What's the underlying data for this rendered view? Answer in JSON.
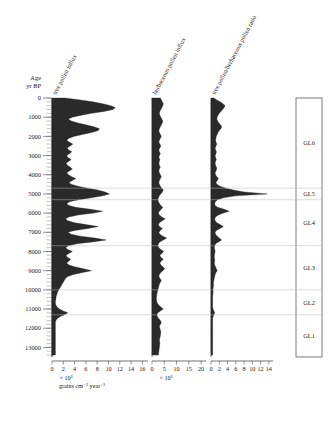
{
  "figure": {
    "age_axis": {
      "label_line1": "Age",
      "label_line2": "yr BP",
      "ticks": [
        0,
        1000,
        2000,
        3000,
        4000,
        5000,
        6000,
        7000,
        8000,
        9000,
        10000,
        11000,
        12000,
        13000
      ],
      "range": [
        0,
        13500
      ],
      "minor_interval": 200
    },
    "units": {
      "influx_exponent": "× 10³",
      "influx_units": "grains cm⁻² year⁻¹"
    },
    "zones": {
      "items": [
        {
          "label": "GL6",
          "top": 0,
          "bottom": 4700
        },
        {
          "label": "GL5",
          "top": 4700,
          "bottom": 5300
        },
        {
          "label": "GL4",
          "top": 5300,
          "bottom": 7700
        },
        {
          "label": "GL3",
          "top": 7700,
          "bottom": 10000
        },
        {
          "label": "GL2",
          "top": 10000,
          "bottom": 11300
        },
        {
          "label": "GL1",
          "top": 11300,
          "bottom": 13500
        }
      ]
    }
  },
  "chart_data": [
    {
      "type": "area",
      "panel": 1,
      "title": "tree pollen influx",
      "xlabel": "× 10³ grains cm⁻² year⁻¹",
      "ylabel": "Age yr BP",
      "xlim": [
        0,
        17
      ],
      "ylim": [
        0,
        13500
      ],
      "xticks": [
        0,
        2,
        4,
        6,
        8,
        10,
        12,
        14,
        16
      ],
      "grid": false,
      "orientation": "horizontal-depth",
      "x": [
        0,
        100,
        200,
        300,
        400,
        500,
        600,
        700,
        800,
        900,
        1000,
        1100,
        1200,
        1300,
        1400,
        1500,
        1600,
        1700,
        1800,
        1900,
        2000,
        2100,
        2200,
        2300,
        2400,
        2500,
        2600,
        2700,
        2800,
        2900,
        3000,
        3100,
        3200,
        3300,
        3400,
        3500,
        3600,
        3700,
        3800,
        3900,
        4000,
        4100,
        4200,
        4300,
        4400,
        4500,
        4600,
        4700,
        4800,
        4900,
        5000,
        5100,
        5200,
        5300,
        5400,
        5500,
        5600,
        5700,
        5800,
        5900,
        6000,
        6100,
        6200,
        6300,
        6400,
        6500,
        6600,
        6700,
        6800,
        6900,
        7000,
        7100,
        7200,
        7300,
        7400,
        7500,
        7600,
        7700,
        7800,
        7900,
        8000,
        8100,
        8200,
        8300,
        8400,
        8500,
        8600,
        8700,
        8800,
        8900,
        9000,
        9100,
        9200,
        9300,
        9400,
        9500,
        9600,
        9700,
        9800,
        9900,
        10000,
        10100,
        10200,
        10300,
        10400,
        10500,
        10600,
        10700,
        10800,
        10900,
        11000,
        11100,
        11200,
        11300,
        11400,
        11500,
        11600,
        11700,
        11800,
        11900,
        12000,
        12200,
        12400,
        12600,
        12800,
        13000,
        13200,
        13400
      ],
      "values": [
        2.3,
        5.0,
        7.2,
        9.0,
        10.4,
        11.2,
        10.8,
        9.2,
        7.0,
        5.2,
        3.6,
        2.9,
        3.4,
        4.6,
        6.0,
        7.4,
        8.4,
        8.2,
        7.0,
        5.4,
        4.0,
        3.0,
        2.6,
        3.1,
        3.7,
        3.2,
        2.7,
        2.9,
        3.5,
        3.1,
        2.6,
        2.8,
        3.4,
        3.0,
        2.5,
        2.7,
        3.2,
        3.6,
        3.1,
        2.6,
        2.9,
        3.5,
        4.2,
        3.6,
        3.0,
        3.4,
        4.6,
        6.3,
        8.1,
        9.4,
        10.2,
        9.0,
        7.0,
        4.8,
        3.2,
        2.6,
        3.0,
        4.2,
        6.8,
        9.0,
        7.4,
        4.6,
        3.0,
        2.4,
        2.8,
        4.0,
        6.0,
        8.2,
        6.4,
        4.0,
        2.8,
        3.4,
        5.0,
        7.6,
        9.6,
        7.2,
        4.4,
        2.9,
        2.4,
        2.8,
        3.6,
        3.0,
        2.5,
        2.7,
        3.3,
        3.0,
        2.6,
        3.0,
        4.0,
        5.6,
        7.0,
        5.4,
        3.8,
        2.8,
        2.4,
        2.2,
        2.0,
        1.8,
        1.6,
        1.4,
        1.2,
        1.0,
        0.9,
        0.8,
        0.7,
        0.7,
        0.6,
        0.6,
        0.7,
        0.9,
        1.3,
        2.0,
        2.8,
        2.2,
        1.4,
        0.9,
        0.7,
        0.6,
        0.6,
        0.6,
        0.6,
        0.6,
        0.6,
        0.6,
        0.6,
        0.6,
        0.6,
        0.6
      ]
    },
    {
      "type": "area",
      "panel": 2,
      "title": "herbaceous pollen influx",
      "xlabel": "× 10³ grains cm⁻² year⁻¹",
      "ylabel": "Age yr BP",
      "xlim": [
        0,
        22
      ],
      "ylim": [
        0,
        13500
      ],
      "xticks": [
        0,
        5,
        10,
        15,
        20
      ],
      "grid": false,
      "orientation": "horizontal-depth",
      "x": [
        0,
        100,
        200,
        300,
        400,
        500,
        600,
        700,
        800,
        900,
        1000,
        1100,
        1200,
        1300,
        1400,
        1500,
        1600,
        1700,
        1800,
        1900,
        2000,
        2100,
        2200,
        2300,
        2400,
        2500,
        2600,
        2700,
        2800,
        2900,
        3000,
        3100,
        3200,
        3300,
        3400,
        3500,
        3600,
        3700,
        3800,
        3900,
        4000,
        4100,
        4200,
        4300,
        4400,
        4500,
        4600,
        4700,
        4800,
        4900,
        5000,
        5100,
        5200,
        5300,
        5400,
        5500,
        5600,
        5700,
        5800,
        5900,
        6000,
        6100,
        6200,
        6300,
        6400,
        6500,
        6600,
        6700,
        6800,
        6900,
        7000,
        7100,
        7200,
        7300,
        7400,
        7500,
        7600,
        7700,
        7800,
        7900,
        8000,
        8100,
        8200,
        8300,
        8400,
        8500,
        8600,
        8700,
        8800,
        8900,
        9000,
        9100,
        9200,
        9300,
        9400,
        9500,
        9600,
        9700,
        9800,
        9900,
        10000,
        10100,
        10200,
        10300,
        10400,
        10500,
        10600,
        10700,
        10800,
        10900,
        11000,
        11100,
        11200,
        11300,
        11400,
        11500,
        11600,
        11700,
        11800,
        11900,
        12000,
        12200,
        12400,
        12600,
        12800,
        13000,
        13200,
        13400
      ],
      "values": [
        3.4,
        3.8,
        4.2,
        4.6,
        4.4,
        4.0,
        3.6,
        3.2,
        3.0,
        3.2,
        3.6,
        4.0,
        4.4,
        4.2,
        3.8,
        3.4,
        3.0,
        2.8,
        3.0,
        3.4,
        3.8,
        3.4,
        3.0,
        2.8,
        3.2,
        3.6,
        3.2,
        2.8,
        3.0,
        3.4,
        3.0,
        2.8,
        3.2,
        3.0,
        2.8,
        3.0,
        3.4,
        3.0,
        2.8,
        3.0,
        3.4,
        3.8,
        3.4,
        3.0,
        2.8,
        3.0,
        3.4,
        4.0,
        4.6,
        4.2,
        3.6,
        3.0,
        2.6,
        2.4,
        2.6,
        3.0,
        3.6,
        4.4,
        3.8,
        3.0,
        2.6,
        3.0,
        4.0,
        5.4,
        4.2,
        3.0,
        2.6,
        3.0,
        4.2,
        3.4,
        2.8,
        3.2,
        4.4,
        6.0,
        4.6,
        3.2,
        2.6,
        2.4,
        2.8,
        3.6,
        4.8,
        4.0,
        3.2,
        3.6,
        4.6,
        3.8,
        3.2,
        3.6,
        4.4,
        5.2,
        4.4,
        3.6,
        3.0,
        2.8,
        3.2,
        3.8,
        3.4,
        3.0,
        2.8,
        2.6,
        2.4,
        2.2,
        2.0,
        1.9,
        1.8,
        1.8,
        1.9,
        2.2,
        2.8,
        3.6,
        4.6,
        3.4,
        2.4,
        2.0,
        2.2,
        2.8,
        3.4,
        3.8,
        3.4,
        3.0,
        3.2,
        3.6,
        3.4,
        3.0,
        3.2,
        3.0,
        2.8,
        2.6
      ]
    },
    {
      "type": "area",
      "panel": 3,
      "title": "tree pollen/herbaceous pollen ratio",
      "xlabel": "ratio",
      "ylabel": "Age yr BP",
      "xlim": [
        0,
        15
      ],
      "ylim": [
        0,
        13500
      ],
      "xticks": [
        0,
        2,
        4,
        6,
        8,
        10,
        12,
        14
      ],
      "grid": false,
      "orientation": "horizontal-depth",
      "x": [
        0,
        100,
        200,
        300,
        400,
        500,
        600,
        700,
        800,
        900,
        1000,
        1100,
        1200,
        1300,
        1400,
        1500,
        1600,
        1700,
        1800,
        1900,
        2000,
        2100,
        2200,
        2300,
        2400,
        2500,
        2600,
        2700,
        2800,
        2900,
        3000,
        3100,
        3200,
        3300,
        3400,
        3500,
        3600,
        3700,
        3800,
        3900,
        4000,
        4100,
        4200,
        4300,
        4400,
        4500,
        4600,
        4700,
        4800,
        4900,
        5000,
        5100,
        5200,
        5300,
        5400,
        5500,
        5600,
        5700,
        5800,
        5900,
        6000,
        6100,
        6200,
        6300,
        6400,
        6500,
        6600,
        6700,
        6800,
        6900,
        7000,
        7100,
        7200,
        7300,
        7400,
        7500,
        7600,
        7700,
        7800,
        7900,
        8000,
        8100,
        8200,
        8300,
        8400,
        8500,
        8600,
        8700,
        8800,
        8900,
        9000,
        9100,
        9200,
        9300,
        9400,
        9500,
        9600,
        9700,
        9800,
        9900,
        10000,
        10100,
        10200,
        10300,
        10400,
        10500,
        10600,
        10700,
        10800,
        10900,
        11000,
        11100,
        11200,
        11300,
        11400,
        11500,
        11600,
        11700,
        11800,
        11900,
        12000,
        12200,
        12400,
        12600,
        12800,
        13000,
        13200,
        13400
      ],
      "values": [
        0.7,
        1.4,
        2.2,
        2.9,
        3.4,
        3.2,
        2.8,
        2.4,
        2.0,
        1.7,
        1.5,
        1.4,
        1.6,
        1.9,
        2.3,
        2.6,
        2.4,
        2.0,
        1.7,
        1.5,
        1.3,
        1.2,
        1.1,
        1.2,
        1.4,
        1.2,
        1.0,
        1.1,
        1.3,
        1.2,
        1.0,
        1.1,
        1.3,
        1.1,
        1.0,
        1.1,
        1.3,
        1.4,
        1.2,
        1.0,
        1.1,
        1.4,
        1.8,
        1.5,
        1.2,
        1.4,
        2.2,
        3.6,
        5.4,
        8.0,
        13.6,
        6.0,
        3.0,
        1.6,
        1.1,
        0.9,
        1.0,
        1.6,
        3.2,
        4.4,
        3.0,
        1.8,
        1.1,
        0.9,
        1.0,
        1.4,
        2.2,
        3.0,
        2.2,
        1.3,
        1.0,
        1.1,
        1.5,
        2.0,
        2.6,
        1.8,
        1.1,
        0.9,
        0.8,
        0.9,
        1.0,
        0.9,
        0.8,
        0.8,
        0.9,
        0.9,
        0.8,
        0.9,
        1.1,
        1.3,
        1.5,
        1.2,
        1.0,
        0.9,
        0.8,
        0.7,
        0.6,
        0.6,
        0.6,
        0.5,
        0.5,
        0.5,
        0.5,
        0.4,
        0.4,
        0.4,
        0.4,
        0.4,
        0.4,
        0.4,
        0.5,
        0.7,
        0.9,
        0.7,
        0.5,
        0.4,
        0.4,
        0.4,
        0.4,
        0.4,
        0.4,
        0.4,
        0.4,
        0.4,
        0.4,
        0.4,
        0.4,
        0.4
      ]
    }
  ]
}
